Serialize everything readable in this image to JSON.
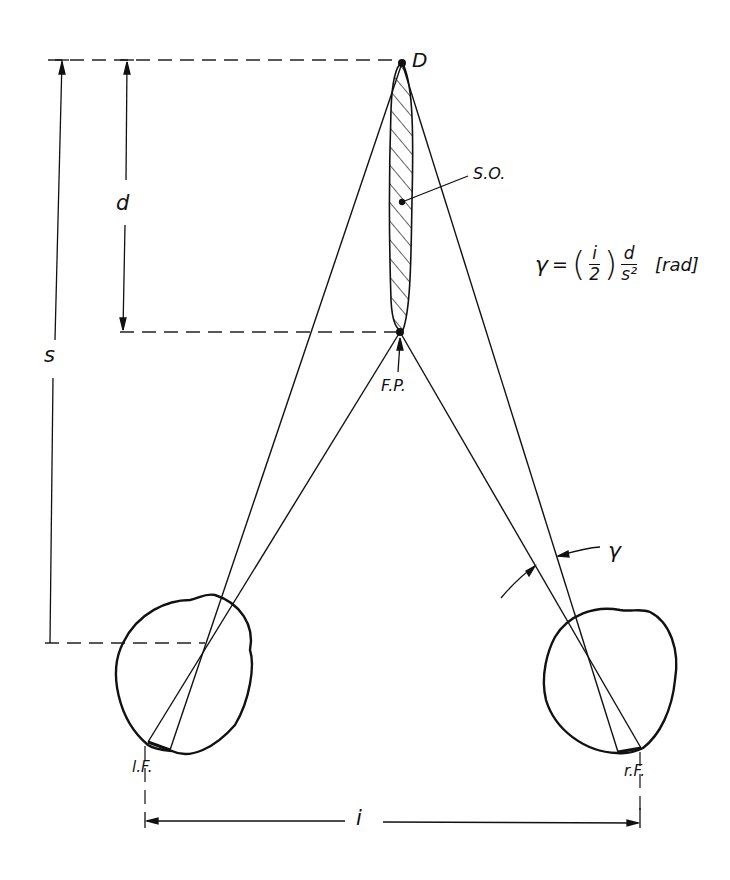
{
  "diagram": {
    "labels": {
      "far_point": "D",
      "stereo_object": "S.O.",
      "fixation_point": "F.P.",
      "left_fovea": "l.F.",
      "right_fovea": "r.F.",
      "distance_s": "s",
      "depth_d": "d",
      "interocular_i": "i",
      "angle": "γ"
    },
    "formula": {
      "lhs": "γ",
      "equals": "=",
      "paren_open": "(",
      "frac1_num": "i",
      "frac1_den": "2",
      "paren_close": ")",
      "frac2_num": "d",
      "frac2_den": "s²",
      "unit": "[rad]"
    },
    "colors": {
      "ink": "#111111",
      "background": "#ffffff"
    }
  }
}
